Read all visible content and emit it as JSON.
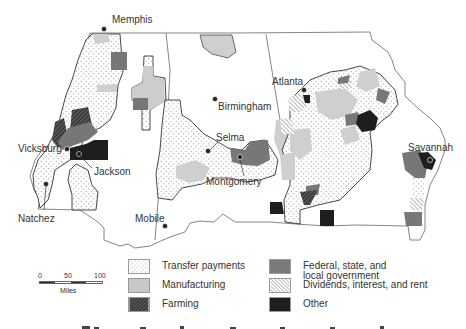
{
  "cities": [
    {
      "name": "Memphis",
      "x": 104,
      "y": 19
    },
    {
      "name": "Atlanta",
      "x": 272,
      "y": 79
    },
    {
      "name": "Birmingham",
      "x": 218,
      "y": 103
    },
    {
      "name": "Selma",
      "x": 215,
      "y": 136
    },
    {
      "name": "Montgomery",
      "x": 208,
      "y": 181
    },
    {
      "name": "Vicksburg",
      "x": 18,
      "y": 146
    },
    {
      "name": "Jackson",
      "x": 92,
      "y": 170
    },
    {
      "name": "Natchez",
      "x": 17,
      "y": 218
    },
    {
      "name": "Mobile",
      "x": 135,
      "y": 217
    },
    {
      "name": "Savannah",
      "x": 412,
      "y": 145
    }
  ],
  "legend": {
    "items": [
      {
        "key": "transfer",
        "label": "Transfer payments"
      },
      {
        "key": "manufacturing",
        "label": "Manufacturing"
      },
      {
        "key": "farming",
        "label": "Farming"
      },
      {
        "key": "government",
        "label": "Federal, state, and local government"
      },
      {
        "key": "dividends",
        "label": "Dividends, interest, and rent"
      },
      {
        "key": "other",
        "label": "Other"
      }
    ]
  },
  "scale": {
    "ticks": [
      "0",
      "50",
      "100"
    ],
    "unit": "Miles"
  },
  "colors": {
    "manufacturing": "#c8c8c8",
    "government": "#7a7a7a",
    "other": "#1e1e1e",
    "border": "#555555"
  }
}
